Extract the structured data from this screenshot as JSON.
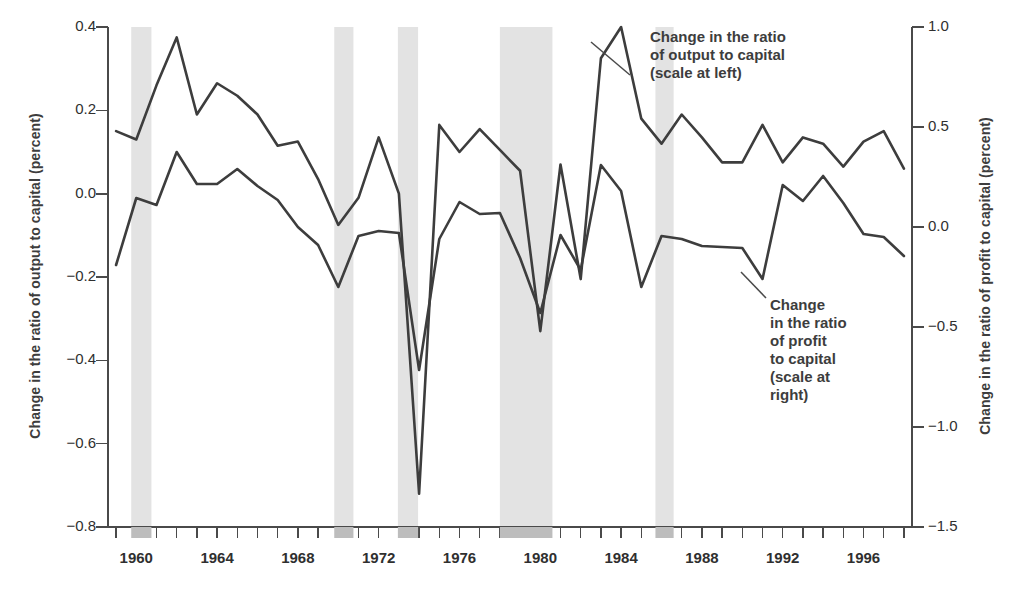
{
  "chart_data": {
    "type": "line",
    "title": "",
    "xlabel": "",
    "ylabel": "Change in the ratio of output to capital (percent)",
    "ylabel_right": "Change in the ratio of profit to capital (percent)",
    "xlim": [
      1958.6,
      1998.4
    ],
    "ylim": [
      -0.8,
      0.4
    ],
    "ylim_right": [
      -1.5,
      1.0
    ],
    "grid": false,
    "legend_position": "inline-annotations",
    "yticks": [
      0.4,
      0.2,
      0.0,
      -0.2,
      -0.4,
      -0.6,
      -0.8
    ],
    "ytick_labels": [
      "0.4",
      "0.2",
      "0.0",
      "−0.2",
      "−0.4",
      "−0.6",
      "−0.8"
    ],
    "yticks_right": [
      1.0,
      0.5,
      0.0,
      -0.5,
      -1.0,
      -1.5
    ],
    "ytick_labels_right": [
      "1.0",
      "0.5",
      "0.0",
      "−0.5",
      "−1.0",
      "−1.5"
    ],
    "xticks": [
      1959,
      1960,
      1961,
      1962,
      1963,
      1964,
      1965,
      1966,
      1967,
      1968,
      1969,
      1970,
      1971,
      1972,
      1973,
      1974,
      1975,
      1976,
      1977,
      1978,
      1979,
      1980,
      1981,
      1982,
      1983,
      1984,
      1985,
      1986,
      1987,
      1988,
      1989,
      1990,
      1991,
      1992,
      1993,
      1994,
      1995,
      1996,
      1997,
      1998
    ],
    "xtick_labels": [
      {
        "year": 1960,
        "label": "1960"
      },
      {
        "year": 1964,
        "label": "1964"
      },
      {
        "year": 1968,
        "label": "1968"
      },
      {
        "year": 1972,
        "label": "1972"
      },
      {
        "year": 1976,
        "label": "1976"
      },
      {
        "year": 1980,
        "label": "1980"
      },
      {
        "year": 1984,
        "label": "1984"
      },
      {
        "year": 1988,
        "label": "1988"
      },
      {
        "year": 1992,
        "label": "1992"
      },
      {
        "year": 1996,
        "label": "1996"
      }
    ],
    "x": [
      1959,
      1960,
      1961,
      1962,
      1963,
      1964,
      1965,
      1966,
      1967,
      1968,
      1969,
      1970,
      1971,
      1972,
      1973,
      1974,
      1975,
      1976,
      1977,
      1978,
      1979,
      1980,
      1981,
      1982,
      1983,
      1984,
      1985,
      1986,
      1987,
      1988,
      1989,
      1990,
      1991,
      1992,
      1993,
      1994,
      1995,
      1996,
      1997,
      1998
    ],
    "series": [
      {
        "name": "Change in the ratio of output to capital",
        "axis": "left",
        "color": "#3d3d3d",
        "values": [
          0.15,
          0.13,
          0.26,
          0.375,
          0.19,
          0.265,
          0.235,
          0.19,
          0.115,
          0.125,
          0.035,
          -0.075,
          -0.01,
          0.135,
          0.0,
          -0.72,
          0.165,
          0.1,
          0.155,
          0.105,
          0.055,
          -0.33,
          0.07,
          -0.205,
          0.325,
          0.4,
          0.18,
          0.12,
          0.19,
          0.135,
          0.075,
          0.075,
          0.165,
          0.075,
          0.135,
          0.12,
          0.065,
          0.125,
          0.15,
          0.06
        ]
      },
      {
        "name": "Change in the ratio of profit to capital",
        "axis": "right",
        "color": "#3d3d3d",
        "values": [
          -0.19,
          0.145,
          0.11,
          0.375,
          0.215,
          0.215,
          0.29,
          0.205,
          0.135,
          0.0,
          -0.09,
          -0.3,
          -0.045,
          -0.02,
          -0.03,
          -0.715,
          -0.06,
          0.125,
          0.065,
          0.07,
          -0.155,
          -0.43,
          -0.04,
          -0.215,
          0.31,
          0.18,
          -0.3,
          -0.045,
          -0.06,
          -0.095,
          -0.1,
          -0.105,
          -0.26,
          0.21,
          0.13,
          0.255,
          0.12,
          -0.035,
          -0.05,
          -0.145
        ]
      }
    ],
    "shaded_bands": [
      {
        "start": 1959.75,
        "end": 1960.75,
        "label": "recession"
      },
      {
        "start": 1969.8,
        "end": 1970.75,
        "label": "recession"
      },
      {
        "start": 1972.95,
        "end": 1973.95,
        "label": "recession"
      },
      {
        "start": 1978.0,
        "end": 1980.6,
        "label": "recession"
      },
      {
        "start": 1985.7,
        "end": 1986.6,
        "label": "recession"
      }
    ],
    "band_color": "#e3e3e3",
    "annotations": [
      {
        "id": "annotation-output",
        "text": "Change in the ratio\nof output to capital\n(scale at left)",
        "x_px": 650,
        "y_px": 28,
        "leader_from_x": 630,
        "leader_from_y": 75,
        "leader_to_x": 591,
        "leader_to_y": 42
      },
      {
        "id": "annotation-profit",
        "text": "Change\nin the ratio\nof profit\nto capital\n(scale at\nright)",
        "x_px": 770,
        "y_px": 296,
        "leader_from_x": 766,
        "leader_from_y": 298,
        "leader_to_x": 741,
        "leader_to_y": 272
      }
    ]
  }
}
